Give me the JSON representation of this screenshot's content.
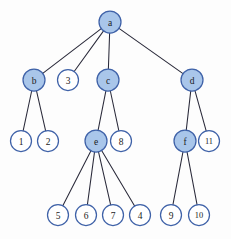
{
  "figure": {
    "type": "tree-diagram",
    "width": 231,
    "height": 239,
    "background_color": "#fdfdfd"
  },
  "style": {
    "node_fill_highlight": "#a9c6ea",
    "node_fill_plain": "#ffffff",
    "node_stroke": "#3f62a8",
    "edge_color": "#2a2a3a",
    "label_color": "#1b1b22",
    "node_radius": 11
  },
  "nodes": [
    {
      "id": "a",
      "label": "a",
      "x": 110,
      "y": 22,
      "r": 11,
      "filled": true,
      "level": 0
    },
    {
      "id": "b",
      "label": "b",
      "x": 34,
      "y": 80,
      "r": 11,
      "filled": true,
      "level": 1
    },
    {
      "id": "n3",
      "label": "3",
      "x": 68,
      "y": 80,
      "r": 10.5,
      "filled": false,
      "level": 1
    },
    {
      "id": "c",
      "label": "c",
      "x": 108,
      "y": 80,
      "r": 11,
      "filled": true,
      "level": 1
    },
    {
      "id": "d",
      "label": "d",
      "x": 192,
      "y": 80,
      "r": 11,
      "filled": true,
      "level": 1
    },
    {
      "id": "n1",
      "label": "1",
      "x": 21,
      "y": 141,
      "r": 10.5,
      "filled": false,
      "level": 2
    },
    {
      "id": "n2",
      "label": "2",
      "x": 48,
      "y": 141,
      "r": 10.5,
      "filled": false,
      "level": 2
    },
    {
      "id": "e",
      "label": "e",
      "x": 96,
      "y": 141,
      "r": 11,
      "filled": true,
      "level": 2
    },
    {
      "id": "n8",
      "label": "8",
      "x": 121,
      "y": 141,
      "r": 10.5,
      "filled": false,
      "level": 2
    },
    {
      "id": "f",
      "label": "f",
      "x": 185,
      "y": 141,
      "r": 11,
      "filled": true,
      "level": 2
    },
    {
      "id": "n11",
      "label": "11",
      "x": 209,
      "y": 141,
      "r": 10.5,
      "filled": false,
      "level": 2
    },
    {
      "id": "n5",
      "label": "5",
      "x": 58,
      "y": 215,
      "r": 10.5,
      "filled": false,
      "level": 3
    },
    {
      "id": "n6",
      "label": "6",
      "x": 86,
      "y": 215,
      "r": 10.5,
      "filled": false,
      "level": 3
    },
    {
      "id": "n7",
      "label": "7",
      "x": 113,
      "y": 215,
      "r": 10.5,
      "filled": false,
      "level": 3
    },
    {
      "id": "n4",
      "label": "4",
      "x": 140,
      "y": 215,
      "r": 10.5,
      "filled": false,
      "level": 3
    },
    {
      "id": "n9",
      "label": "9",
      "x": 171,
      "y": 215,
      "r": 10.5,
      "filled": false,
      "level": 3
    },
    {
      "id": "n10",
      "label": "10",
      "x": 199,
      "y": 215,
      "r": 10.5,
      "filled": false,
      "level": 3
    }
  ],
  "edges": [
    {
      "from": "a",
      "to": "b"
    },
    {
      "from": "a",
      "to": "n3"
    },
    {
      "from": "a",
      "to": "c"
    },
    {
      "from": "a",
      "to": "d"
    },
    {
      "from": "b",
      "to": "n1"
    },
    {
      "from": "b",
      "to": "n2"
    },
    {
      "from": "c",
      "to": "e"
    },
    {
      "from": "c",
      "to": "n8"
    },
    {
      "from": "d",
      "to": "f"
    },
    {
      "from": "d",
      "to": "n11"
    },
    {
      "from": "e",
      "to": "n5"
    },
    {
      "from": "e",
      "to": "n6"
    },
    {
      "from": "e",
      "to": "n7"
    },
    {
      "from": "e",
      "to": "n4"
    },
    {
      "from": "f",
      "to": "n9"
    },
    {
      "from": "f",
      "to": "n10"
    }
  ]
}
